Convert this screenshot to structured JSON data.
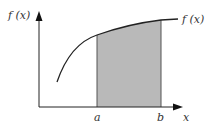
{
  "diagram": {
    "type": "definite-integral-area",
    "y_axis_label": "f (x)",
    "curve_label": "f (x)",
    "x_axis_label": "x",
    "lower_bound_label": "a",
    "upper_bound_label": "b",
    "colors": {
      "axis": "#222222",
      "curve": "#222222",
      "shade": "#b9b9b9",
      "text": "#333333"
    }
  }
}
